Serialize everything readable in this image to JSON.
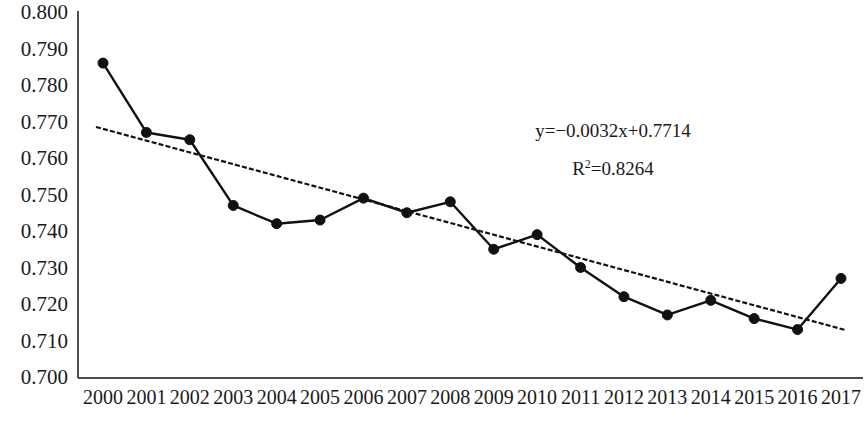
{
  "chart_data": {
    "type": "line",
    "title": "",
    "subtitle": "",
    "xlabel": "",
    "ylabel": "",
    "categories": [
      "2000",
      "2001",
      "2002",
      "2003",
      "2004",
      "2005",
      "2006",
      "2007",
      "2008",
      "2009",
      "2010",
      "2011",
      "2012",
      "2013",
      "2014",
      "2015",
      "2016",
      "2017"
    ],
    "series": [
      {
        "name": "value",
        "values": [
          0.786,
          0.767,
          0.765,
          0.747,
          0.742,
          0.743,
          0.749,
          0.745,
          0.748,
          0.735,
          0.739,
          0.73,
          0.722,
          0.717,
          0.721,
          0.716,
          0.713,
          0.727
        ],
        "marker": "filled-circle",
        "line_style": "solid",
        "color": "#111111"
      },
      {
        "name": "trendline",
        "line_style": "dashed",
        "color": "#111111",
        "equation": "y=-0.0032x+0.7714",
        "slope": -0.0032,
        "intercept": 0.7714,
        "r_squared": 0.8264,
        "start_value": 0.7685,
        "end_value": 0.7129
      }
    ],
    "ylim": [
      0.7,
      0.8
    ],
    "ytick_step": 0.01,
    "ytick_labels": [
      "0.800",
      "0.790",
      "0.780",
      "0.770",
      "0.760",
      "0.750",
      "0.740",
      "0.730",
      "0.720",
      "0.710",
      "0.700"
    ],
    "ytick_values": [
      0.8,
      0.79,
      0.78,
      0.77,
      0.76,
      0.75,
      0.74,
      0.73,
      0.72,
      0.71,
      0.7
    ],
    "grid": false,
    "legend": "none",
    "annotations": [
      {
        "text": "y=−0.0032x+0.7714",
        "x": 2009.5,
        "y": 0.768
      },
      {
        "text": "R²=0.8264",
        "x": 2009.5,
        "y": 0.758
      }
    ]
  },
  "annotations": {
    "equation_prefix": "y=−0.0032x+0.7714",
    "r2_base": "R",
    "r2_exponent": "2",
    "r2_value": "=0.8264"
  }
}
